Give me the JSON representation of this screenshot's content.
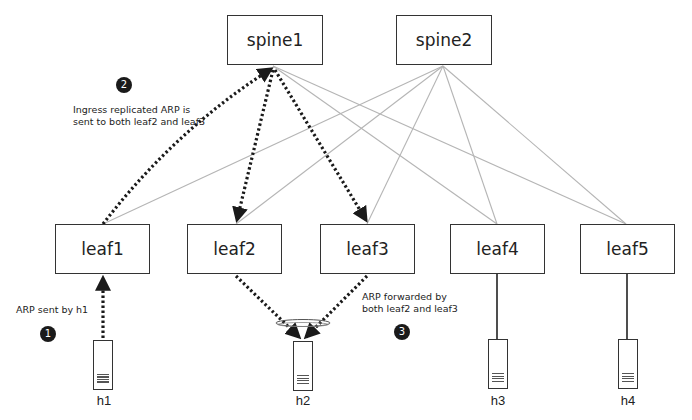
{
  "diagram": {
    "colors": {
      "box_border": "#333333",
      "link": "#b0b0b0",
      "arp_path": "#1a1a1a",
      "badge": "#1a1a1a"
    },
    "spines": [
      {
        "id": "spine1",
        "label": "spine1"
      },
      {
        "id": "spine2",
        "label": "spine2"
      }
    ],
    "leaves": [
      {
        "id": "leaf1",
        "label": "leaf1"
      },
      {
        "id": "leaf2",
        "label": "leaf2"
      },
      {
        "id": "leaf3",
        "label": "leaf3"
      },
      {
        "id": "leaf4",
        "label": "leaf4"
      },
      {
        "id": "leaf5",
        "label": "leaf5"
      }
    ],
    "hosts": [
      {
        "id": "h1",
        "label": "h1",
        "attached_to": "leaf1"
      },
      {
        "id": "h2",
        "label": "h2",
        "attached_to": [
          "leaf2",
          "leaf3"
        ]
      },
      {
        "id": "h3",
        "label": "h3",
        "attached_to": "leaf4"
      },
      {
        "id": "h4",
        "label": "h4",
        "attached_to": "leaf5"
      }
    ],
    "steps": [
      {
        "number": "1",
        "text": "ARP sent by h1"
      },
      {
        "number": "2",
        "text_line1": "Ingress replicated ARP is",
        "text_line2": "sent to both leaf2 and leaf3"
      },
      {
        "number": "3",
        "text_line1": "ARP forwarded by",
        "text_line2": "both leaf2 and leaf3"
      }
    ]
  }
}
